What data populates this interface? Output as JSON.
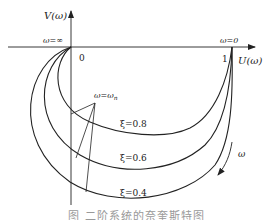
{
  "figure": {
    "y_axis_label": "V(ω)",
    "x_axis_label": "U(ω)",
    "origin_label": "0",
    "unit_label": "1",
    "omega_inf_label": "ω=∞",
    "omega_zero_label": "ω=0",
    "omega_n_label": "ω=ω",
    "omega_n_sub": "n",
    "direction_label": "ω",
    "curves": [
      {
        "label": "ξ=0.8",
        "zeta": 0.8
      },
      {
        "label": "ξ=0.6",
        "zeta": 0.6
      },
      {
        "label": "ξ=0.4",
        "zeta": 0.4
      }
    ],
    "caption": "图 二阶系统的奈奎斯特图"
  },
  "colors": {
    "line": "#222222",
    "background": "#ffffff"
  }
}
